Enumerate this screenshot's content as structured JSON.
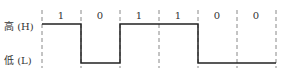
{
  "diagram": {
    "type": "digital-signal-timing",
    "levels": {
      "high_label": "高 (H)",
      "low_label": "低 (L)"
    },
    "bits": [
      "1",
      "0",
      "1",
      "1",
      "0",
      "0"
    ],
    "colors": {
      "line": "#222222",
      "dash": "#888888",
      "text": "#333333"
    }
  }
}
